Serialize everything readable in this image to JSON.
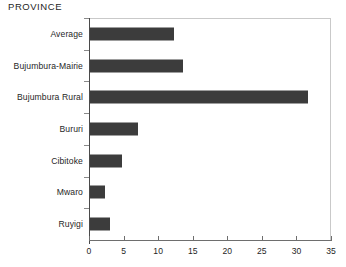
{
  "chart_data": {
    "type": "bar",
    "orientation": "horizontal",
    "title": "PROVINCE",
    "xlabel": "",
    "ylabel": "",
    "categories": [
      "Average",
      "Bujumbura-Mairie",
      "Bujumbura Rural",
      "Bururi",
      "Cibitoke",
      "Mwaro",
      "Ruyigi"
    ],
    "values": [
      12.2,
      13.5,
      31.5,
      7.0,
      4.6,
      2.2,
      2.9
    ],
    "xlim": [
      0,
      35
    ],
    "xticks": [
      0,
      5,
      10,
      15,
      20,
      25,
      30,
      35
    ],
    "xtick_labels": [
      "0",
      "5",
      "10",
      "15",
      "20",
      "25",
      "30",
      "35"
    ],
    "grid": false,
    "legend": null,
    "bar_color": "#3c3c3c",
    "background_color": "#ffffff",
    "axis_color": "#6e6e6e",
    "frame_color": "#c9c9c9"
  }
}
